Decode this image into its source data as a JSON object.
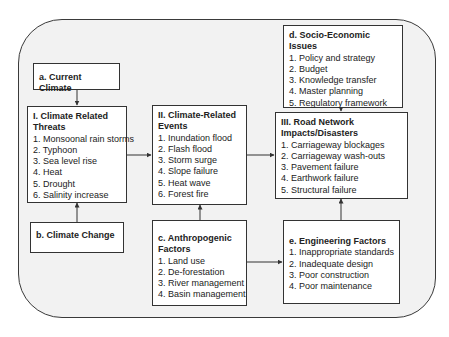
{
  "diagram": {
    "current_climate": {
      "title": "a. Current Climate"
    },
    "climate_change": {
      "title": "b. Climate Change"
    },
    "threats": {
      "title": "I. Climate Related Threats",
      "items": [
        "1. Monsoonal rain storms",
        "2. Typhoon",
        "3. Sea level rise",
        "4. Heat",
        "5. Drought",
        "6. Salinity increase"
      ]
    },
    "events": {
      "title": "II. Climate-Related Events",
      "items": [
        "1. Inundation flood",
        "2. Flash flood",
        "3. Storm surge",
        "4. Slope failure",
        "5. Heat wave",
        "6. Forest fire"
      ]
    },
    "anthropogenic": {
      "title": "c. Anthropogenic Factors",
      "items": [
        "1. Land use",
        "2. De-forestation",
        "3. River management",
        "4. Basin management"
      ]
    },
    "socio_economic": {
      "title": "d. Socio-Economic Issues",
      "items": [
        "1. Policy and strategy",
        "2. Budget",
        "3. Knowledge transfer",
        "4. Master planning",
        "5. Regulatory framework"
      ]
    },
    "road_impacts": {
      "title": "III. Road Network Impacts/Disasters",
      "items": [
        "1. Carriageway blockages",
        "2. Carriageway wash-outs",
        "3. Pavement failure",
        "4. Earthwork failure",
        "5. Structural failure"
      ]
    },
    "engineering": {
      "title": "e. Engineering Factors",
      "items": [
        "1. Inappropriate standards",
        "2. Inadequate design",
        "3. Poor construction",
        "4. Poor maintenance"
      ]
    },
    "colors": {
      "frame_fill": "#f2f2f2",
      "box_fill": "#ffffff",
      "border": "#333333"
    }
  }
}
